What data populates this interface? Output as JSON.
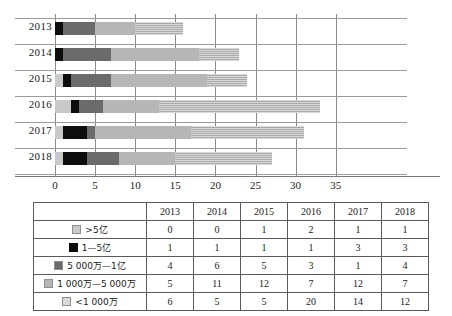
{
  "chart_data": {
    "type": "bar",
    "orientation": "horizontal",
    "stacked": true,
    "title": "",
    "xlabel": "",
    "ylabel": "",
    "xlim": [
      0,
      37
    ],
    "grid": true,
    "legend_position": "table-below",
    "categories": [
      "2013",
      "2014",
      "2015",
      "2016",
      "2017",
      "2018"
    ],
    "xticks": [
      "0",
      "5",
      "10",
      "15",
      "20",
      "25",
      "30",
      "35"
    ],
    "xtick_values": [
      0,
      5,
      10,
      15,
      20,
      25,
      30,
      35
    ],
    "series": [
      {
        "name": ">5亿",
        "swatch": "sw1",
        "color": "#c9c9c9",
        "values": [
          0,
          0,
          1,
          2,
          1,
          1
        ]
      },
      {
        "name": "1—5亿",
        "swatch": "sw2",
        "color": "#0d0d0d",
        "values": [
          1,
          1,
          1,
          1,
          3,
          3
        ]
      },
      {
        "name": "5 000万—1亿",
        "swatch": "sw3",
        "color": "#6b6b6b",
        "values": [
          4,
          6,
          5,
          3,
          1,
          4
        ]
      },
      {
        "name": "1 000万—5 000万",
        "swatch": "sw4",
        "color": "#b6b6b6",
        "values": [
          5,
          11,
          12,
          7,
          12,
          7
        ]
      },
      {
        "name": "<1 000万",
        "swatch": "sw5",
        "color": "#d9d9d9",
        "values": [
          6,
          5,
          5,
          20,
          14,
          12
        ]
      }
    ],
    "totals": [
      16,
      23,
      24,
      33,
      31,
      27
    ]
  },
  "table": {
    "corner_label": "",
    "column_headers": [
      "2013",
      "2014",
      "2015",
      "2016",
      "2017",
      "2018"
    ],
    "rows": [
      {
        "label": ">5亿",
        "swatch": "sw1",
        "values": [
          "0",
          "0",
          "1",
          "2",
          "1",
          "1"
        ]
      },
      {
        "label": "1—5亿",
        "swatch": "sw2",
        "values": [
          "1",
          "1",
          "1",
          "1",
          "3",
          "3"
        ]
      },
      {
        "label": "5 000万—1亿",
        "swatch": "sw3",
        "values": [
          "4",
          "6",
          "5",
          "3",
          "1",
          "4"
        ]
      },
      {
        "label": "1 000万—5 000万",
        "swatch": "sw4",
        "values": [
          "5",
          "11",
          "12",
          "7",
          "12",
          "7"
        ]
      },
      {
        "label": "<1 000万",
        "swatch": "sw5",
        "values": [
          "6",
          "5",
          "5",
          "20",
          "14",
          "12"
        ]
      }
    ]
  }
}
